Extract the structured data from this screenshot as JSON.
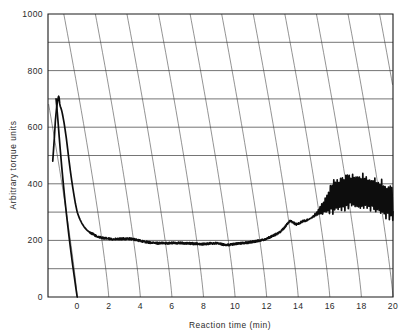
{
  "chart_data": {
    "type": "line",
    "title": "",
    "xlabel": "Reaction time (min)",
    "ylabel": "Arbitrary torque units",
    "xlim": [
      -1.85,
      20
    ],
    "ylim": [
      0,
      1000
    ],
    "xticks": [
      0,
      2,
      4,
      6,
      8,
      10,
      12,
      14,
      16,
      18,
      20
    ],
    "xtick_labels": [
      "0",
      "2",
      "4",
      "6",
      "8",
      "10",
      "12",
      "14",
      "16",
      "18",
      "20"
    ],
    "yticks": [
      0,
      200,
      400,
      600,
      800,
      1000
    ],
    "ytick_labels": [
      "0",
      "200",
      "400",
      "600",
      "800",
      "1000"
    ],
    "y_minor_ticks": [
      100,
      300,
      500,
      700,
      900
    ],
    "grid": "major horizontal lines plus curved chart-recorder time arcs",
    "legend": "none",
    "background": "#ffffff",
    "line_color": "#0d0d0d",
    "grid_color": "#4a4a4a",
    "series": [
      {
        "name": "torque trace",
        "description": "Loading peak, decay to plateau, late rise with oscillation",
        "x": [
          -1.55,
          -1.45,
          -1.38,
          -1.3,
          -1.22,
          -1.18,
          -1.15,
          -1.12,
          -1.1,
          -1.06,
          -1.02,
          -0.98,
          -0.94,
          -0.9,
          -0.84,
          -0.78,
          -0.7,
          -0.62,
          -0.54,
          -0.44,
          -0.34,
          -0.24,
          -0.12,
          0.0,
          0.14,
          0.3,
          0.46,
          0.62,
          0.8,
          1.0,
          1.25,
          1.5,
          1.8,
          2.1,
          2.4,
          2.7,
          3.0,
          3.3,
          3.6,
          3.9,
          4.2,
          4.5,
          4.8,
          5.2,
          5.6,
          6.0,
          6.4,
          6.8,
          7.2,
          7.6,
          8.0,
          8.4,
          8.8,
          9.2,
          9.6,
          10.0,
          10.4,
          10.8,
          11.2,
          11.6,
          12.0,
          12.3,
          12.6,
          12.9,
          13.1,
          13.3,
          13.5,
          13.7,
          13.9,
          14.1,
          14.3,
          14.6,
          14.9,
          15.2,
          15.5,
          15.8,
          16.1,
          16.5,
          17.0,
          17.5,
          18.0,
          18.5,
          19.0,
          19.5,
          20.0
        ],
        "y": [
          480,
          560,
          625,
          672,
          700,
          710,
          706,
          690,
          680,
          672,
          666,
          658,
          648,
          636,
          618,
          596,
          566,
          530,
          492,
          448,
          408,
          372,
          332,
          300,
          278,
          260,
          246,
          236,
          228,
          222,
          214,
          210,
          207,
          205,
          204,
          205,
          206,
          206,
          204,
          200,
          196,
          193,
          191,
          190,
          190,
          191,
          191,
          190,
          189,
          188,
          187,
          189,
          190,
          186,
          184,
          188,
          190,
          192,
          196,
          200,
          206,
          214,
          222,
          232,
          244,
          258,
          270,
          262,
          256,
          262,
          268,
          272,
          282,
          296,
          312,
          330,
          348,
          362,
          372,
          376,
          374,
          366,
          356,
          344,
          330
        ],
        "oscillation": {
          "starts_at_x": 14.6,
          "full_amplitude_from_x": 16.2,
          "max_envelope_high": 405,
          "max_envelope_low": 278,
          "description": "High-frequency saw oscillation growing from ~14.6 min, fully developed 16-20 min"
        }
      },
      {
        "name": "baseline trace",
        "description": "Near-vertical descending pen return to zero at 0 min",
        "x": [
          -1.34,
          -1.3,
          -1.26,
          -1.2,
          -1.14,
          -1.06,
          -0.98,
          -0.88,
          -0.78,
          -0.66,
          -0.54,
          -0.42,
          -0.3,
          -0.18,
          -0.08,
          0.0
        ],
        "y": [
          700,
          676,
          650,
          610,
          566,
          512,
          460,
          400,
          344,
          282,
          224,
          170,
          118,
          70,
          30,
          0
        ]
      }
    ]
  }
}
